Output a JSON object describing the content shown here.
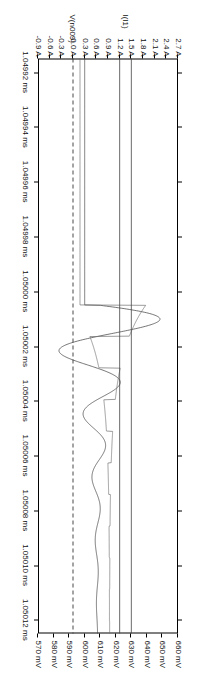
{
  "window": {
    "title": "LTspice waveform viewer"
  },
  "chart_data": {
    "type": "line",
    "title": "",
    "orientation": "rotated-90",
    "grid": false,
    "legend": "none",
    "xlabel": "",
    "x_unit": "ms",
    "x_tick_labels": [
      "1.04992 ms",
      "1.04994 ms",
      "1.04996 ms",
      "1.04998 ms",
      "1.05000 ms",
      "1.05002 ms",
      "1.05004 ms",
      "1.05006 ms",
      "1.05008 ms",
      "1.05010 ms",
      "1.05012 ms"
    ],
    "x_values": [
      1.04992,
      1.04994,
      1.04996,
      1.04998,
      1.05,
      1.05002,
      1.05004,
      1.05006,
      1.05008,
      1.0501,
      1.05012
    ],
    "xlim": [
      1.049915,
      1.050125
    ],
    "axes": [
      {
        "id": "left",
        "label": "I(I1)",
        "unit": "A",
        "tick_labels": [
          "2.7 A",
          "2.4 A",
          "2.1 A",
          "1.8 A",
          "1.5 A",
          "1.2 A",
          "0.9 A",
          "0.6 A",
          "0.3 A",
          "0.0 A",
          "-0.3 A",
          "-0.6 A",
          "-0.9 A"
        ],
        "tick_values": [
          2.7,
          2.4,
          2.1,
          1.8,
          1.5,
          1.2,
          0.9,
          0.6,
          0.3,
          0.0,
          -0.3,
          -0.6,
          -0.9
        ],
        "lim": [
          -0.9,
          2.7
        ],
        "reference_line": 0.0
      },
      {
        "id": "right",
        "label": "V(n009)",
        "unit": "mV",
        "tick_labels": [
          "660 mV",
          "650 mV",
          "640 mV",
          "630 mV",
          "620 mV",
          "610 mV",
          "600 mV",
          "590 mV",
          "580 mV",
          "570 mV"
        ],
        "tick_values": [
          660,
          650,
          640,
          630,
          620,
          610,
          600,
          590,
          580,
          570
        ],
        "lim": [
          570,
          660
        ]
      }
    ],
    "series": [
      {
        "name": "I(I1)",
        "axis": "left",
        "color": "#3a3a3a",
        "style": "solid",
        "description": "damped ringing current, large oscillation decaying to steady state"
      },
      {
        "name": "V(n009)",
        "axis": "right",
        "color": "#707070",
        "style": "solid",
        "description": "node voltage, switching square-edge steps decaying to flat line"
      }
    ],
    "annotations": [
      {
        "type": "dashed-vertical-reference",
        "axis": "left",
        "value": 0.0,
        "label": "0 A reference"
      },
      {
        "type": "cursor",
        "axis": "left",
        "value": 1.5,
        "label": "cursor A"
      },
      {
        "type": "cursor",
        "axis": "left",
        "value": 1.2,
        "label": "cursor B"
      }
    ]
  }
}
